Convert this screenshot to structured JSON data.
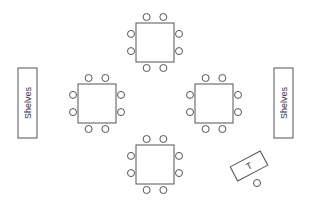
{
  "diagram": {
    "title": "",
    "colors": {
      "stroke": "#555555",
      "fill": "#ffffff",
      "text": "#333333"
    },
    "shelves": [
      {
        "id": "shelves-left",
        "label": "Shelves",
        "x": 18,
        "y": 68,
        "w": 19,
        "h": 70
      },
      {
        "id": "shelves-right",
        "label": "Shelves",
        "x": 274,
        "y": 68,
        "w": 19,
        "h": 70
      }
    ],
    "tables": [
      {
        "id": "table-top",
        "x": 136,
        "y": 23,
        "w": 38,
        "h": 39
      },
      {
        "id": "table-left",
        "x": 78,
        "y": 84,
        "w": 38,
        "h": 39
      },
      {
        "id": "table-right",
        "x": 195,
        "y": 84,
        "w": 38,
        "h": 39
      },
      {
        "id": "table-bottom",
        "x": 136,
        "y": 145,
        "w": 38,
        "h": 39
      }
    ],
    "chair_radius": 3.5,
    "chair_offsets": {
      "top": [
        [
          0.28,
          -6
        ],
        [
          0.72,
          -6
        ]
      ],
      "bottom": [
        [
          0.28,
          6
        ],
        [
          0.72,
          6
        ]
      ],
      "left": [
        [
          -5,
          0.28
        ],
        [
          -5,
          0.72
        ]
      ],
      "right": [
        [
          5,
          0.28
        ],
        [
          5,
          0.72
        ]
      ]
    },
    "teacher_desk": {
      "label": "T",
      "cx": 249,
      "cy": 166,
      "w": 34,
      "h": 16,
      "rotate": -28
    },
    "teacher_chair": {
      "cx": 257,
      "cy": 183
    }
  }
}
